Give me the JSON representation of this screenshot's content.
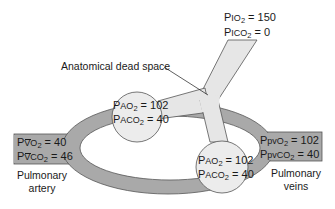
{
  "diagram": {
    "type": "physiology-schematic",
    "colors": {
      "vessel": "#a9a9a9",
      "airway": "#e6e6e6",
      "alveolus": "#ececec",
      "outline": "#555555"
    },
    "inspired": {
      "po2_prefix": "P",
      "po2_sub": "I",
      "po2_gas": "O",
      "po2_eq": " = 150",
      "pco2_prefix": "P",
      "pco2_sub": "I",
      "pco2_gas": "CO",
      "pco2_eq": " = 0"
    },
    "dead_space_label": "Anatomical dead space",
    "alveolus_left": {
      "po2_prefix": "P",
      "po2_sub": "A",
      "po2_gas": "O",
      "po2_eq": " = 102",
      "pco2_prefix": "P",
      "pco2_sub": "A",
      "pco2_gas": "CO",
      "pco2_eq": " = 40"
    },
    "alveolus_right": {
      "po2_prefix": "P",
      "po2_sub": "A",
      "po2_gas": "O",
      "po2_eq": " = 102",
      "pco2_prefix": "P",
      "pco2_sub": "A",
      "pco2_gas": "CO",
      "pco2_eq": " = 40"
    },
    "pulmonary_artery": {
      "po2_prefix": "P",
      "po2_sub": "V",
      "po2_gas": "O",
      "po2_eq": " = 40",
      "pco2_prefix": "P",
      "pco2_sub": "V",
      "pco2_gas": "CO",
      "pco2_eq": " = 46",
      "caption_line1": "Pulmonary",
      "caption_line2": "artery"
    },
    "pulmonary_veins": {
      "po2_prefix": "P",
      "po2_sub": "pv",
      "po2_gas": "O",
      "po2_eq": " = 102",
      "pco2_prefix": "P",
      "pco2_sub": "pv",
      "pco2_gas": "CO",
      "pco2_eq": " = 40",
      "caption_line1": "Pulmonary",
      "caption_line2": "veins"
    },
    "subscript_two": "2"
  }
}
